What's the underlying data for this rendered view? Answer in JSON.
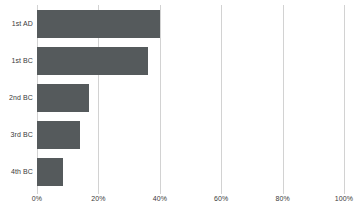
{
  "chart_data": {
    "type": "bar",
    "orientation": "horizontal",
    "title": "",
    "subtitle": "",
    "xlabel": "",
    "ylabel": "",
    "categories": [
      "1st AD",
      "1st BC",
      "2nd BC",
      "3rd BC",
      "4th BC"
    ],
    "values": [
      40,
      36,
      17,
      14,
      8.5
    ],
    "value_suffix": "%",
    "xlim": [
      0,
      100
    ],
    "xticks": [
      0,
      20,
      40,
      60,
      80,
      100
    ],
    "xtick_labels": [
      "0%",
      "20%",
      "40%",
      "60%",
      "80%",
      "100%"
    ],
    "grid": "vertical",
    "legend": "none",
    "series": [
      {
        "name": "",
        "values": [
          40,
          36,
          17,
          14,
          8.5
        ]
      }
    ]
  },
  "style": {
    "bar_color": "#555a5c",
    "gridline_color": "#d2d2d2",
    "text_color": "#3a3a3a",
    "background": "#ffffff"
  },
  "title_fragment": "‾‾‾"
}
